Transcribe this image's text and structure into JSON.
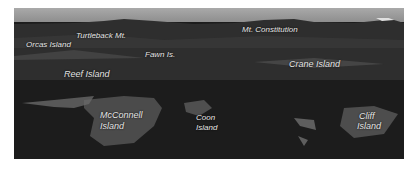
{
  "photo": {
    "description": "Aerial grayscale view of San Juan Islands with labeled islands and peaks",
    "labels": [
      {
        "id": "orcas",
        "text": "Orcas Island"
      },
      {
        "id": "turtleback",
        "text": "Turtleback Mt."
      },
      {
        "id": "fawn",
        "text": "Fawn Is."
      },
      {
        "id": "constitution",
        "text": "Mt. Constitution"
      },
      {
        "id": "reef",
        "text": "Reef Island"
      },
      {
        "id": "crane",
        "text": "Crane Island"
      },
      {
        "id": "mcconnell_1",
        "text": "McConnell"
      },
      {
        "id": "mcconnell_2",
        "text": "Island"
      },
      {
        "id": "coon_1",
        "text": "Coon"
      },
      {
        "id": "coon_2",
        "text": "Island"
      },
      {
        "id": "cliff_1",
        "text": "Cliff"
      },
      {
        "id": "cliff_2",
        "text": "Island"
      }
    ]
  }
}
